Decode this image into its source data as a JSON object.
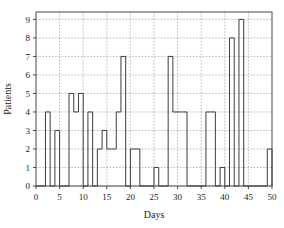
{
  "chart_data": {
    "type": "line",
    "subtype": "step-post",
    "title": "",
    "subtitle": "",
    "xlabel": "Days",
    "ylabel": "Patients",
    "xlim": [
      0,
      50
    ],
    "ylim": [
      0,
      9.4
    ],
    "xticks": [
      0,
      5,
      10,
      15,
      20,
      25,
      30,
      35,
      40,
      45,
      50
    ],
    "yticks": [
      0,
      1,
      2,
      3,
      4,
      5,
      6,
      7,
      8,
      9
    ],
    "xtick_labels": [
      "0",
      "5",
      "10",
      "15",
      "20",
      "25",
      "30",
      "35",
      "40",
      "45",
      "50"
    ],
    "ytick_labels": [
      "0",
      "1",
      "2",
      "3",
      "4",
      "5",
      "6",
      "7",
      "8",
      "9"
    ],
    "grid": true,
    "grid_style": "dashed",
    "grid_color": "#9a9a9a",
    "legend": null,
    "legend_position": "none",
    "line_color": "#3d3d3d",
    "line_width": 1,
    "axes_color": "#4a4a4a",
    "background": "#ffffff",
    "series": [
      {
        "name": "Patients",
        "x": [
          0,
          1,
          2,
          3,
          4,
          5,
          6,
          7,
          8,
          9,
          10,
          11,
          12,
          13,
          14,
          15,
          16,
          17,
          18,
          19,
          20,
          21,
          22,
          23,
          24,
          25,
          26,
          27,
          28,
          29,
          30,
          31,
          32,
          33,
          34,
          35,
          36,
          37,
          38,
          39,
          40,
          41,
          42,
          43,
          44,
          45,
          46,
          47,
          48,
          49,
          50
        ],
        "values": [
          0,
          0,
          4,
          0,
          3,
          0,
          0,
          5,
          4,
          5,
          0,
          4,
          0,
          2,
          3,
          2,
          2,
          4,
          7,
          0,
          2,
          2,
          0,
          0,
          0,
          1,
          0,
          0,
          7,
          4,
          4,
          4,
          0,
          0,
          0,
          0,
          4,
          4,
          0,
          1,
          0,
          8,
          0,
          9,
          0,
          0,
          0,
          0,
          0,
          2,
          0
        ]
      }
    ]
  },
  "axis_titles": {
    "x": "Days",
    "y": "Patients"
  }
}
